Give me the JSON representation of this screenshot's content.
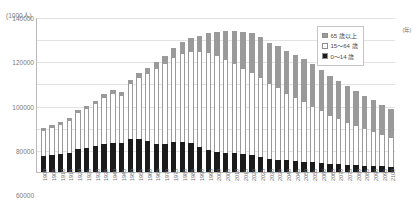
{
  "unit_label": "(1000人)",
  "legend": {
    "items": [
      {
        "label": "65 歳以上",
        "color": "#9a9a9a",
        "key": "old"
      },
      {
        "label": "15～64 歳",
        "color": "#ffffff",
        "key": "mid"
      },
      {
        "label": "0～14 歳",
        "color": "#1b1b1b",
        "key": "young"
      }
    ]
  },
  "x_axis_unit": "(年)",
  "chart_data": {
    "type": "bar",
    "stacked": true,
    "title": "",
    "subtitle": "",
    "xlabel": "(年)",
    "ylabel": "(1000人)",
    "grid": true,
    "legend_position": "top-right",
    "ylim": [
      0,
      140000
    ],
    "yticks": [
      0,
      20000,
      40000,
      60000,
      80000,
      100000,
      120000,
      140000
    ],
    "ytick_labels": [
      "0",
      "20000",
      "40000",
      "60000",
      "80000",
      "100000",
      "120000",
      "140000"
    ],
    "categories": [
      "1900",
      "1905",
      "1910",
      "1915",
      "1920",
      "1925",
      "1930",
      "1935",
      "1940",
      "1945",
      "1950",
      "1955",
      "1960",
      "1965",
      "1970",
      "1975",
      "1980",
      "1985",
      "1990",
      "1995",
      "2000",
      "2005",
      "2010",
      "2015",
      "2020",
      "2025",
      "2030",
      "2035",
      "2040",
      "2045",
      "2050",
      "2055",
      "2060",
      "2065",
      "2070",
      "2075",
      "2080",
      "2085",
      "2090",
      "2095",
      "2100"
    ],
    "series": [
      {
        "name": "0～14 歳",
        "key": "young",
        "color": "#1b1b1b",
        "values": [
          14500,
          15400,
          16500,
          17600,
          20416,
          21924,
          23579,
          25545,
          26369,
          26477,
          29786,
          30123,
          28434,
          25529,
          25153,
          27221,
          27507,
          26033,
          22486,
          20014,
          18472,
          17521,
          16803,
          15887,
          15032,
          13240,
          12039,
          11287,
          10732,
          10116,
          9387,
          8714,
          8112,
          7578,
          7076,
          6600,
          6160,
          5750,
          5365,
          5000,
          4660
        ]
      },
      {
        "name": "15～64 歳",
        "key": "mid",
        "color": "#ffffff",
        "values": [
          23000,
          24500,
          26300,
          28300,
          32605,
          34792,
          37807,
          41484,
          44492,
          42408,
          49658,
          54729,
          60469,
          67444,
          72119,
          75807,
          78835,
          82506,
          85904,
          87165,
          86220,
          84092,
          81032,
          77282,
          74058,
          71701,
          67730,
          64942,
          59777,
          56580,
          53531,
          50276,
          46766,
          43431,
          40480,
          37820,
          35270,
          32840,
          30560,
          28420,
          26420
        ]
      },
      {
        "name": "65 歳以上",
        "key": "old",
        "color": "#9a9a9a",
        "values": [
          2400,
          2560,
          2740,
          2950,
          2941,
          3021,
          3064,
          3225,
          3454,
          3700,
          4109,
          4747,
          5398,
          6236,
          7393,
          8865,
          10647,
          12468,
          14895,
          18261,
          22005,
          25672,
          29246,
          33465,
          36192,
          36771,
          37160,
          37407,
          38678,
          39192,
          38878,
          38160,
          37304,
          36146,
          34810,
          33380,
          31850,
          30290,
          28760,
          27250,
          25810
        ]
      }
    ],
    "totals": [
      39900,
      42460,
      45540,
      48850,
      55962,
      59737,
      64450,
      70254,
      74313,
      72585,
      83553,
      89599,
      94301,
      99209,
      104665,
      111893,
      116989,
      121007,
      123285,
      125440,
      126697,
      127285,
      127081,
      126634,
      125282,
      121712,
      116929,
      113636,
      109187,
      105888,
      101796,
      97150,
      92182,
      87155,
      82366,
      77800,
      73280,
      68880,
      64685,
      60670,
      56890
    ]
  }
}
